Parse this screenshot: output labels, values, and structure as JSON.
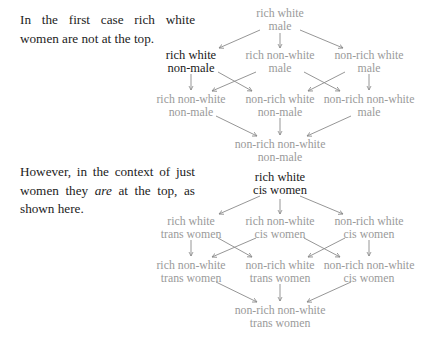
{
  "paragraphs": {
    "first": "In the first case rich white women are not at the top.",
    "second_before": "However, in the context of just women they ",
    "second_em": "are",
    "second_after": " at the top, as shown here."
  },
  "diagram1": {
    "nodes": {
      "top": [
        "rich white",
        "male"
      ],
      "l1a": [
        "rich white",
        "non-male"
      ],
      "l1b": [
        "rich non-white",
        "male"
      ],
      "l1c": [
        "non-rich white",
        "male"
      ],
      "l2a": [
        "rich non-white",
        "non-male"
      ],
      "l2b": [
        "non-rich white",
        "non-male"
      ],
      "l2c": [
        "non-rich non-white",
        "male"
      ],
      "bottom": [
        "non-rich non-white",
        "non-male"
      ]
    },
    "highlighted": "l1a"
  },
  "diagram2": {
    "nodes": {
      "top": [
        "rich white",
        "cis women"
      ],
      "l1a": [
        "rich white",
        "trans women"
      ],
      "l1b": [
        "rich non-white",
        "cis women"
      ],
      "l1c": [
        "non-rich white",
        "cis women"
      ],
      "l2a": [
        "rich non-white",
        "trans women"
      ],
      "l2b": [
        "non-rich white",
        "trans women"
      ],
      "l2c": [
        "non-rich non-white",
        "cis women"
      ],
      "bottom": [
        "non-rich non-white",
        "trans women"
      ]
    },
    "highlighted": "top"
  },
  "colors": {
    "text": "#222222",
    "highlight": "#1a1a1a",
    "muted": "#9a9a9a",
    "edge": "#8a8a8a"
  }
}
